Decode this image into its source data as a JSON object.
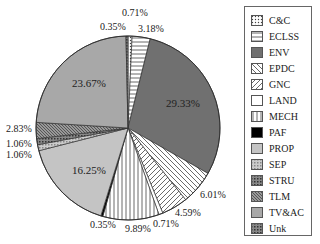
{
  "chart_data": {
    "type": "pie",
    "title": "",
    "categories": [
      "C&C",
      "ECLSS",
      "ENV",
      "EPDC",
      "GNC",
      "LAND",
      "MECH",
      "PAF",
      "PROP",
      "SEP",
      "STRU",
      "TLM",
      "TV&AC",
      "Unk"
    ],
    "values": [
      0.71,
      3.18,
      29.33,
      6.01,
      4.59,
      0.71,
      9.89,
      0.35,
      16.25,
      1.06,
      1.06,
      2.83,
      23.67,
      0.35
    ],
    "labels": [
      "0.71%",
      "3.18%",
      "29.33%",
      "6.01%",
      "4.59%",
      "0.71%",
      "9.89%",
      "0.35%",
      "16.25%",
      "1.06%",
      "1.06%",
      "2.83%",
      "23.67%",
      "0.35%"
    ],
    "fills": [
      "dots",
      "hlines",
      "#707070",
      "bdiag",
      "fdiag",
      "#ffffff",
      "vlines",
      "#000000",
      "#c4c4c4",
      "cross-light",
      "cross-dark",
      "dense",
      "#a8a8a8",
      "cross-dark"
    ],
    "legend_position": "right",
    "start_angle": "top, clockwise"
  },
  "legend": {
    "items": [
      "C&C",
      "ECLSS",
      "ENV",
      "EPDC",
      "GNC",
      "LAND",
      "MECH",
      "PAF",
      "PROP",
      "SEP",
      "STRU",
      "TLM",
      "TV&AC",
      "Unk"
    ]
  }
}
